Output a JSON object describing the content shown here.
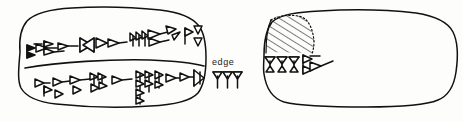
{
  "figure": {
    "kind": "cuneiform-tablet-line-drawing",
    "background_color": "#fdfdfc",
    "ink_color": "#111111"
  },
  "annotations": {
    "edge_label": "edge"
  },
  "tablets": [
    {
      "id": "obverse",
      "name": "left-tablet",
      "position": "left",
      "outline": {
        "shape": "rounded-irregular-rectangle",
        "x": 18,
        "y": 12,
        "width": 190,
        "height": 95
      },
      "ruling_lines": 1,
      "text_lines": [
        {
          "line_number": 1,
          "sign_count": 12,
          "signs": [
            "winkelhaken-cluster",
            "horizontal-wedge",
            "vertical-wedge",
            "horizontal-wedge",
            "crossed-wedges",
            "horizontal-wedge",
            "vertical-wedge",
            "three-vertical-wedges",
            "horizontal-wedge",
            "angled-wedge",
            "vertical-wedge",
            "stacked-triangles"
          ]
        },
        {
          "line_number": 2,
          "sign_count": 13,
          "signs": [
            "vertical-wedge",
            "vertical-wedge",
            "vertical-wedge",
            "horizontal-wedge",
            "double-wedge-cluster",
            "vertical-wedge",
            "horizontal-wedge",
            "stacked-wedge-column",
            "stacked-wedge-column",
            "vertical-wedge",
            "horizontal-wedge",
            "horizontal-wedge",
            "boxed-wedge"
          ]
        }
      ]
    },
    {
      "id": "reverse",
      "name": "right-tablet",
      "position": "right",
      "outline": {
        "shape": "rounded-irregular-rectangle",
        "x": 262,
        "y": 12,
        "width": 192,
        "height": 95
      },
      "damage_area": {
        "name": "broken-surface-hatching",
        "fill": "diagonal-hatch",
        "x": 266,
        "y": 16,
        "width": 48,
        "height": 40
      },
      "ruling_lines": 0,
      "text_lines": [
        {
          "line_number": 1,
          "sign_count": 4,
          "signs": [
            "vertical-wedge",
            "vertical-wedge",
            "vertical-wedge",
            "horizontal-wedge-with-triangle"
          ]
        }
      ]
    }
  ],
  "edge_signs": {
    "name": "edge-wedge-group",
    "sign_count": 3,
    "signs": [
      "vertical-wedge",
      "vertical-wedge",
      "vertical-wedge"
    ]
  }
}
